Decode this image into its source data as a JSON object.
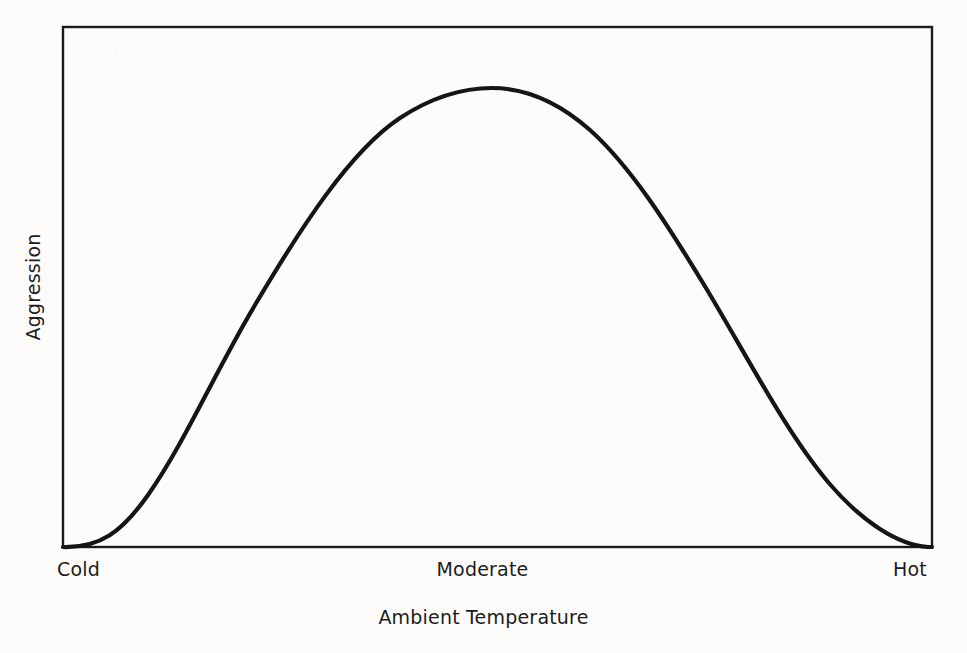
{
  "figure": {
    "background_color": "#fdfcfb",
    "ink_color": "#1a1a1a"
  },
  "axes": {
    "frame": {
      "left": 63,
      "top": 27,
      "right": 932,
      "bottom": 547,
      "border_color": "#1a1a1a",
      "border_width": 2.4
    },
    "x_axis_title": "Ambient Temperature",
    "y_axis_title": "Aggression",
    "x_tick_labels": [
      "Cold",
      "Moderate",
      "Hot"
    ],
    "y_tick_labels": []
  },
  "curve": {
    "color": "#151515",
    "width": 4.2,
    "path": "M 63,547 C 100,548 122,532 148,495 C 185,442 215,372 255,305 C 300,229 350,151 400,118 C 432,97 462,88 492,88 C 524,88 556,100 590,130 C 630,166 666,222 706,288 C 748,358 786,432 828,482 C 862,522 898,545 928,547 L 932,547"
  },
  "chart_data": {
    "type": "line",
    "title": "",
    "subtitle": "",
    "xlabel": "Ambient Temperature",
    "ylabel": "Aggression",
    "xlim": [
      0,
      100
    ],
    "ylim": [
      0,
      100
    ],
    "grid": false,
    "legend": "none",
    "xtick_positions": [
      0,
      50,
      100
    ],
    "xtick_labels": [
      "Cold",
      "Moderate",
      "Hot"
    ],
    "ytick_labels": [],
    "annotation": "Inverted-U relationship: aggression rises from cold to moderate ambient temperature, peaks slightly left of Moderate, then declines toward Hot.",
    "series": [
      {
        "name": "Aggression",
        "x": [
          0,
          5,
          10,
          15,
          20,
          25,
          30,
          35,
          40,
          45,
          49,
          55,
          60,
          65,
          70,
          75,
          80,
          85,
          90,
          95,
          100
        ],
        "values": [
          0,
          1,
          5,
          12,
          22,
          35,
          50,
          65,
          79,
          91,
          99,
          98,
          92,
          82,
          69,
          55,
          40,
          26,
          14,
          5,
          0
        ]
      }
    ]
  }
}
